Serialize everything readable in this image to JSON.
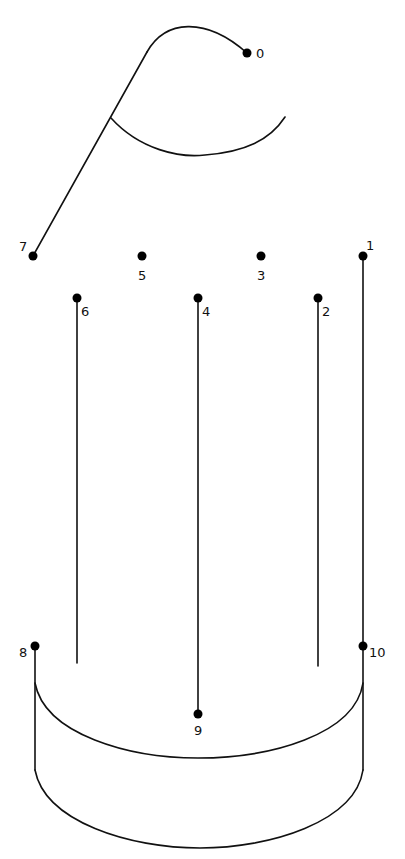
{
  "puzzle": {
    "type": "connect-the-dots",
    "colors": {
      "line": "#111111",
      "dot": "#000000",
      "background": "#ffffff"
    },
    "dots": [
      {
        "n": "0",
        "x": 247,
        "y": 53,
        "lx": 256,
        "ly": 58
      },
      {
        "n": "1",
        "x": 363,
        "y": 256,
        "lx": 366,
        "ly": 250
      },
      {
        "n": "2",
        "x": 318,
        "y": 298,
        "lx": 322,
        "ly": 316
      },
      {
        "n": "3",
        "x": 261,
        "y": 256,
        "lx": 257,
        "ly": 280
      },
      {
        "n": "4",
        "x": 198,
        "y": 298,
        "lx": 202,
        "ly": 316
      },
      {
        "n": "5",
        "x": 142,
        "y": 256,
        "lx": 138,
        "ly": 280
      },
      {
        "n": "6",
        "x": 77,
        "y": 298,
        "lx": 81,
        "ly": 316
      },
      {
        "n": "7",
        "x": 33,
        "y": 256,
        "lx": 19,
        "ly": 251
      },
      {
        "n": "8",
        "x": 35,
        "y": 646,
        "lx": 19,
        "ly": 657
      },
      {
        "n": "9",
        "x": 198,
        "y": 714,
        "lx": 194,
        "ly": 735
      },
      {
        "n": "10",
        "x": 363,
        "y": 646,
        "lx": 369,
        "ly": 657
      }
    ]
  }
}
